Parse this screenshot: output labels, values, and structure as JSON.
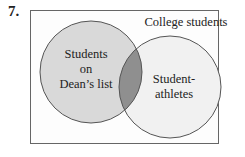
{
  "problem_number": "7.",
  "diagram": {
    "type": "venn",
    "universe_label": "College students",
    "sets": [
      {
        "name": "left",
        "label_lines": [
          "Students",
          "on",
          "Dean’s list"
        ],
        "fill": "#d9d9d9"
      },
      {
        "name": "right",
        "label_lines": [
          "Student-",
          "athletes"
        ],
        "fill": "#f1f1f1"
      }
    ],
    "intersection_fill": "#8f8f8f",
    "stroke": "#555555",
    "frame_stroke": "#666666"
  }
}
